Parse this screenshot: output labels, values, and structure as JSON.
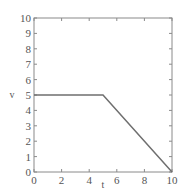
{
  "chart_data": {
    "type": "line",
    "title": "",
    "xlabel": "t",
    "ylabel": "v",
    "xlim": [
      0,
      10
    ],
    "ylim": [
      0,
      10
    ],
    "xticks": [
      0,
      2,
      4,
      6,
      8,
      10
    ],
    "yticks": [
      0,
      1,
      2,
      3,
      4,
      5,
      6,
      7,
      8,
      9,
      10
    ],
    "grid": false,
    "legend": null,
    "series": [
      {
        "name": "v(t)",
        "x": [
          0,
          5,
          10
        ],
        "y": [
          5,
          5,
          0
        ],
        "color": "#6f6f6f"
      }
    ]
  },
  "colors": {
    "axes": "#8a8a8a",
    "line": "#6f6f6f",
    "text": "#555555"
  }
}
